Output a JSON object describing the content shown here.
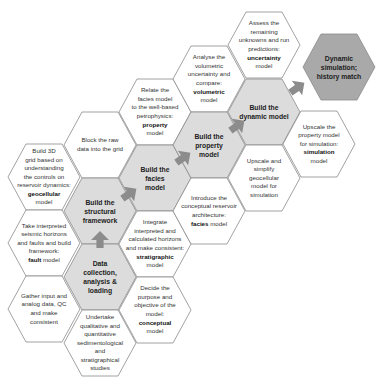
{
  "colors": {
    "hex_fill": "#ffffff",
    "hex_stroke": "#8a8a8a",
    "core_fill": "#dcdcdc",
    "final_fill": "#a9a9a9",
    "arrow": "#8c8c8c",
    "text": "#333333"
  },
  "hexes": [
    {
      "id": "geocellular",
      "type": "task",
      "cx": 44,
      "cy": 177,
      "lines": [
        "Build 3D",
        "grid based on",
        "understanding",
        "the controls on",
        "reservoir dynamics:"
      ],
      "bold": "geocellular",
      "suffix": "model"
    },
    {
      "id": "fault",
      "type": "task",
      "cx": 44,
      "cy": 243,
      "lines": [
        "Take interpreted",
        "seismic horizons",
        "and faults and build",
        "framework:"
      ],
      "bold": "fault",
      "suffix": "model",
      "inline": true
    },
    {
      "id": "gather",
      "type": "task",
      "cx": 44,
      "cy": 309,
      "lines": [
        "Gather input and",
        "analog data, QC",
        "and make",
        "consistent"
      ]
    },
    {
      "id": "block",
      "type": "task",
      "cx": 100,
      "cy": 145,
      "lines": [
        "Block the raw",
        "data into the grid"
      ]
    },
    {
      "id": "structural",
      "type": "core",
      "cx": 100,
      "cy": 211,
      "lines": [
        "Build the",
        "structural",
        "framework"
      ]
    },
    {
      "id": "data",
      "type": "core",
      "cx": 100,
      "cy": 277,
      "lines": [
        "Data",
        "collection,",
        "analysis &",
        "loading"
      ]
    },
    {
      "id": "undertake",
      "type": "task",
      "cx": 100,
      "cy": 343,
      "lines": [
        "Undertake",
        "qualitative and",
        "quantitative",
        "sedimentological",
        "and",
        "stratigraphical",
        "studies"
      ]
    },
    {
      "id": "relate",
      "type": "task",
      "cx": 155,
      "cy": 112,
      "lines": [
        "Relate the",
        "facies model",
        "to the well-based",
        "petrophysics:"
      ],
      "bold": "property",
      "suffix": "model"
    },
    {
      "id": "facies",
      "type": "core",
      "cx": 155,
      "cy": 178,
      "lines": [
        "Build the",
        "facies",
        "model"
      ]
    },
    {
      "id": "stratigraphic",
      "type": "task",
      "cx": 155,
      "cy": 244,
      "lines": [
        "Integrate",
        "interpreted and",
        "calculated horizons",
        "and make consistent:"
      ],
      "bold": "stratigraphic",
      "suffix": "model"
    },
    {
      "id": "conceptual",
      "type": "task",
      "cx": 155,
      "cy": 310,
      "lines": [
        "Decide the",
        "purpose and",
        "objective of the",
        "model:"
      ],
      "bold": "conceptual",
      "suffix": "model"
    },
    {
      "id": "volumetric",
      "type": "task",
      "cx": 209,
      "cy": 79,
      "lines": [
        "Analyse the",
        "volumetric",
        "uncertainty and",
        "compare:"
      ],
      "bold": "volumetric",
      "suffix": "model"
    },
    {
      "id": "property",
      "type": "core",
      "cx": 209,
      "cy": 145,
      "lines": [
        "Build the",
        "property",
        "model"
      ]
    },
    {
      "id": "introduce",
      "type": "task",
      "cx": 209,
      "cy": 211,
      "lines": [
        "Introduce the",
        "conceptual reservoir",
        "architecture:"
      ],
      "bold": "facies",
      "suffix": "model",
      "inline": true
    },
    {
      "id": "uncertainty",
      "type": "task",
      "cx": 264,
      "cy": 45,
      "lines": [
        "Assess the",
        "remaining",
        "unknowns and run",
        "predictions:"
      ],
      "bold": "uncertainty",
      "suffix": "model"
    },
    {
      "id": "dynamic",
      "type": "core",
      "cx": 264,
      "cy": 112,
      "lines": [
        "Build the",
        "dynamic model"
      ]
    },
    {
      "id": "upscale_simplify",
      "type": "task",
      "cx": 264,
      "cy": 178,
      "lines": [
        "Upscale and",
        "simplify",
        "geocellular",
        "model for",
        "simulation"
      ]
    },
    {
      "id": "simulation",
      "type": "task",
      "cx": 319,
      "cy": 144,
      "lines": [
        "Upscale the",
        "property model",
        "for simulation:"
      ],
      "bold": "simulation",
      "suffix": "model"
    },
    {
      "id": "history",
      "type": "final",
      "cx": 339,
      "cy": 67,
      "lines": [
        "Dynamic",
        "simulation;",
        "history match"
      ]
    }
  ],
  "arrows": [
    {
      "id": "arrow-data-to-structural",
      "x": 100,
      "y": 240,
      "dir": "up"
    },
    {
      "id": "arrow-structural-to-facies",
      "x": 129,
      "y": 194,
      "dir": "upright"
    },
    {
      "id": "arrow-facies-to-property",
      "x": 183,
      "y": 158,
      "dir": "upright"
    },
    {
      "id": "arrow-property-to-dynamic",
      "x": 237,
      "y": 126,
      "dir": "upright"
    },
    {
      "id": "arrow-dynamic-to-history",
      "x": 297,
      "y": 88,
      "dir": "upright"
    }
  ]
}
